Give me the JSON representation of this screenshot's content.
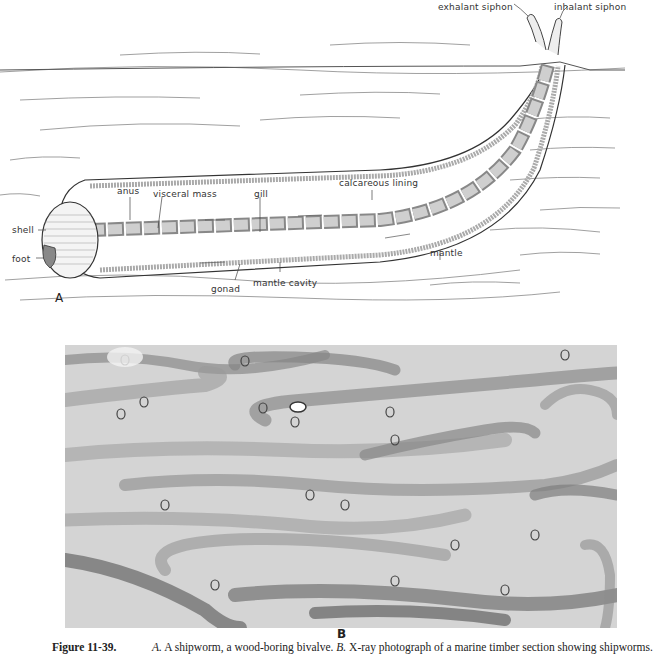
{
  "figure": {
    "panel_a": {
      "letter": "A",
      "labels": {
        "exhalant_siphon": "exhalant siphon",
        "inhalant_siphon": "inhalant siphon",
        "anus": "anus",
        "visceral_mass": "visceral mass",
        "gill": "gill",
        "calcareous_lining": "calcareous lining",
        "shell": "shell",
        "foot": "foot",
        "mantle": "mantle",
        "gonad": "gonad",
        "mantle_cavity": "mantle cavity"
      }
    },
    "panel_b": {
      "letter": "B",
      "description": "X-ray photograph of a marine timber section showing shipworms"
    },
    "caption": {
      "number": "Figure 11-39.",
      "a_marker": "A.",
      "a_text": " A shipworm, a wood-boring bivalve. ",
      "b_marker": "B.",
      "b_text": " X-ray photograph of a marine timber section showing shipworms."
    }
  }
}
